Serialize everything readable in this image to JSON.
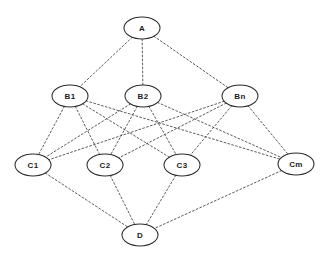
{
  "diagram": {
    "background_color": "#ffffff",
    "edge_color": "#4a4a4a",
    "node_stroke_color": "#2b2b2b",
    "node_fill_color": "#ffffff",
    "label_color": "#1c1c1c",
    "edge_style": "dotted",
    "node_shape": "ellipse",
    "node_rx": 18,
    "node_ry": 11,
    "nodes": [
      {
        "id": "A",
        "label": "A",
        "x": 142,
        "y": 28,
        "layer": 0
      },
      {
        "id": "B1",
        "label": "B1",
        "x": 70,
        "y": 96,
        "layer": 1
      },
      {
        "id": "B2",
        "label": "B2",
        "x": 143,
        "y": 96,
        "layer": 1
      },
      {
        "id": "Bn",
        "label": "Bn",
        "x": 240,
        "y": 96,
        "layer": 1
      },
      {
        "id": "C1",
        "label": "C1",
        "x": 33,
        "y": 165,
        "layer": 2
      },
      {
        "id": "C2",
        "label": "C2",
        "x": 105,
        "y": 165,
        "layer": 2
      },
      {
        "id": "C3",
        "label": "C3",
        "x": 182,
        "y": 165,
        "layer": 2
      },
      {
        "id": "Cm",
        "label": "Cm",
        "x": 296,
        "y": 164,
        "layer": 2
      },
      {
        "id": "D",
        "label": "D",
        "x": 140,
        "y": 235,
        "layer": 3
      }
    ],
    "edges": [
      {
        "from": "A",
        "to": "B1"
      },
      {
        "from": "A",
        "to": "B2"
      },
      {
        "from": "A",
        "to": "Bn"
      },
      {
        "from": "B1",
        "to": "C1"
      },
      {
        "from": "B1",
        "to": "C2"
      },
      {
        "from": "B1",
        "to": "C3"
      },
      {
        "from": "B1",
        "to": "Cm"
      },
      {
        "from": "B2",
        "to": "C1"
      },
      {
        "from": "B2",
        "to": "C2"
      },
      {
        "from": "B2",
        "to": "C3"
      },
      {
        "from": "B2",
        "to": "Cm"
      },
      {
        "from": "Bn",
        "to": "C1"
      },
      {
        "from": "Bn",
        "to": "C2"
      },
      {
        "from": "Bn",
        "to": "C3"
      },
      {
        "from": "Bn",
        "to": "Cm"
      },
      {
        "from": "C1",
        "to": "D"
      },
      {
        "from": "C2",
        "to": "D"
      },
      {
        "from": "C3",
        "to": "D"
      },
      {
        "from": "Cm",
        "to": "D"
      }
    ]
  }
}
